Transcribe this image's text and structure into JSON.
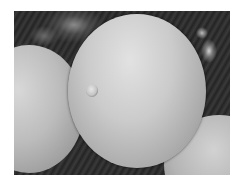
{
  "image": {
    "description": "Grayscale scanning electron micrograph of pollen grains",
    "subject": "pollen-grains",
    "objects": [
      {
        "name": "main-pollen-grain",
        "feature": "single pore (aperture) on left side"
      },
      {
        "name": "left-pollen-grain"
      },
      {
        "name": "bottom-right-pollen-grain"
      },
      {
        "name": "background-debris"
      }
    ],
    "colors": {
      "border": "#ffffff",
      "background": "#1e1e1e",
      "grain_highlight": "#e2e2e2",
      "grain_shadow": "#7a7a7a"
    }
  }
}
